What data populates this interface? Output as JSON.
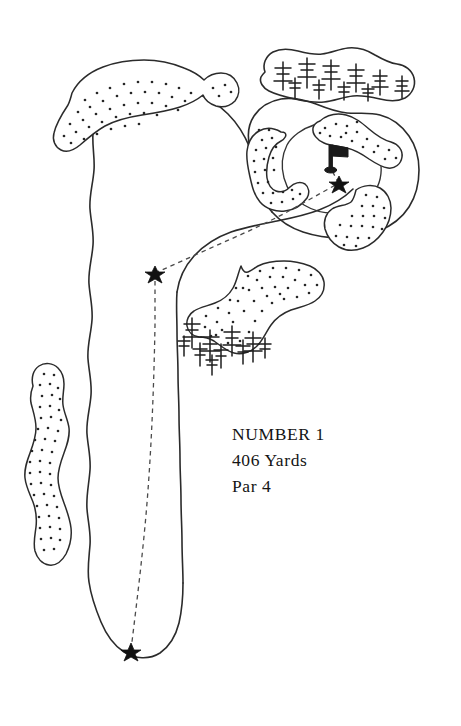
{
  "page": {
    "background_color": "#ffffff",
    "ink_color": "#2b2b2b",
    "width": 461,
    "height": 726
  },
  "hole_info": {
    "number_label": "NUMBER 1",
    "yardage_label": "406 Yards",
    "par_label": "Par 4"
  },
  "map_features": {
    "fairway_name": "fairway-outline",
    "green_name": "putting-green",
    "tee_marker": "tee-star-marker",
    "landing_marker": "landing-zone-star-marker",
    "approach_marker": "approach-ball-star-marker",
    "flagstick": "flagstick-pin",
    "shot_path": "dashed-shot-line",
    "bunkers": [
      "upper-left-waste-bunker",
      "left-rough-long-bunker",
      "right-dogleg-bunker",
      "green-left-crescent-bunker",
      "green-upper-right-bunker",
      "green-lower-right-bunker"
    ],
    "tree_areas": [
      "upper-right-tree-grove",
      "right-fairway-tree-cluster"
    ]
  }
}
